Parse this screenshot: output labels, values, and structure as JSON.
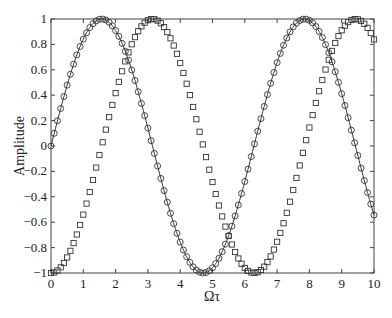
{
  "chart_data": {
    "type": "line",
    "title": "",
    "xlabel": "Ωτ",
    "ylabel": "Amplitude",
    "xlim": [
      0,
      10
    ],
    "ylim": [
      -1,
      1
    ],
    "xticks": [
      0,
      1,
      2,
      3,
      4,
      5,
      6,
      7,
      8,
      9,
      10
    ],
    "yticks": [
      -1,
      -0.8,
      -0.6,
      -0.4,
      -0.2,
      0,
      0.2,
      0.4,
      0.6,
      0.8,
      1
    ],
    "ytick_labels": [
      "−1",
      "−0.8",
      "−0.6",
      "−0.4",
      "−0.2",
      "0",
      "0.2",
      "0.4",
      "0.6",
      "0.8",
      "1"
    ],
    "xtick_labels": [
      "0",
      "1",
      "2",
      "3",
      "4",
      "5",
      "6",
      "7",
      "8",
      "9",
      "10"
    ],
    "grid": false,
    "legend": null,
    "sample_step": 0.1,
    "series": [
      {
        "name": "sin(Ωτ) — line with circles",
        "function": "sin",
        "marker": "circle",
        "line": "solid",
        "color": "#333333",
        "x_range": [
          0,
          10
        ],
        "key_points": [
          [
            0,
            0
          ],
          [
            1.57,
            1
          ],
          [
            3.14,
            0
          ],
          [
            4.71,
            -1
          ],
          [
            6.28,
            0
          ],
          [
            7.85,
            1
          ],
          [
            9.42,
            0
          ],
          [
            10,
            -0.544
          ]
        ]
      },
      {
        "name": "-cos(Ωτ) — squares",
        "function": "neg_cos",
        "marker": "square",
        "line": "none",
        "color": "#333333",
        "x_range": [
          0,
          10
        ],
        "key_points": [
          [
            0,
            -1
          ],
          [
            1.57,
            0
          ],
          [
            3.14,
            1
          ],
          [
            4.71,
            0
          ],
          [
            6.28,
            -1
          ],
          [
            7.85,
            0
          ],
          [
            9.42,
            1
          ],
          [
            10,
            0.839
          ]
        ]
      }
    ]
  },
  "layout": {
    "plot_left": 51,
    "plot_right": 374,
    "plot_top": 19,
    "plot_bottom": 273
  }
}
